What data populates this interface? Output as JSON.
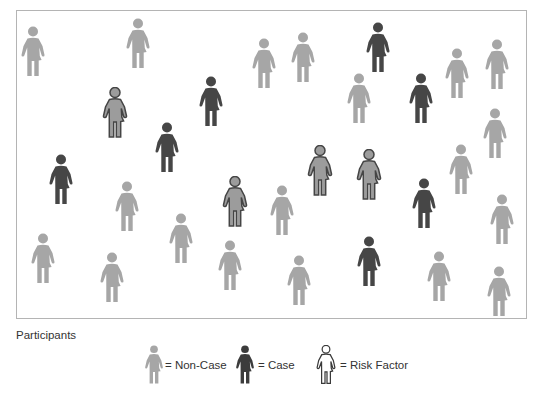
{
  "figure": {
    "title": "Participants",
    "colors": {
      "non_case": "#a6a6a6",
      "case": "#464646",
      "risk_fill": "#9c9c9c",
      "risk_stroke": "#454545",
      "frame": "#b4b4b4"
    },
    "participants": [
      {
        "type": "non_case",
        "x": 33,
        "y": 52
      },
      {
        "type": "non_case",
        "x": 138,
        "y": 44
      },
      {
        "type": "non_case",
        "x": 264,
        "y": 64
      },
      {
        "type": "non_case",
        "x": 303,
        "y": 58
      },
      {
        "type": "case",
        "x": 378,
        "y": 48
      },
      {
        "type": "non_case",
        "x": 457,
        "y": 74
      },
      {
        "type": "non_case",
        "x": 497,
        "y": 65
      },
      {
        "type": "risk_factor",
        "x": 115,
        "y": 113
      },
      {
        "type": "case",
        "x": 211,
        "y": 102
      },
      {
        "type": "non_case",
        "x": 359,
        "y": 99
      },
      {
        "type": "case",
        "x": 421,
        "y": 99
      },
      {
        "type": "case",
        "x": 167,
        "y": 148
      },
      {
        "type": "non_case",
        "x": 495,
        "y": 134
      },
      {
        "type": "case",
        "x": 61,
        "y": 180
      },
      {
        "type": "risk_factor",
        "x": 320,
        "y": 171
      },
      {
        "type": "risk_factor",
        "x": 369,
        "y": 175
      },
      {
        "type": "non_case",
        "x": 461,
        "y": 170
      },
      {
        "type": "non_case",
        "x": 127,
        "y": 207
      },
      {
        "type": "risk_factor",
        "x": 235,
        "y": 202
      },
      {
        "type": "non_case",
        "x": 282,
        "y": 211
      },
      {
        "type": "case",
        "x": 424,
        "y": 204
      },
      {
        "type": "non_case",
        "x": 502,
        "y": 220
      },
      {
        "type": "non_case",
        "x": 181,
        "y": 239
      },
      {
        "type": "non_case",
        "x": 43,
        "y": 259
      },
      {
        "type": "non_case",
        "x": 112,
        "y": 278
      },
      {
        "type": "non_case",
        "x": 230,
        "y": 266
      },
      {
        "type": "non_case",
        "x": 299,
        "y": 281
      },
      {
        "type": "case",
        "x": 369,
        "y": 262
      },
      {
        "type": "non_case",
        "x": 439,
        "y": 277
      },
      {
        "type": "non_case",
        "x": 499,
        "y": 292
      }
    ],
    "counts": {
      "total": 30,
      "non_case": 19,
      "case": 7,
      "risk_factor": 4
    }
  },
  "legend": {
    "items": [
      {
        "key": "non_case",
        "label": "= Non-Case",
        "icon": "person-gray-icon"
      },
      {
        "key": "case",
        "label": "= Case",
        "icon": "person-dark-icon"
      },
      {
        "key": "risk_factor",
        "label": "= Risk Factor",
        "icon": "person-outline-icon"
      }
    ]
  }
}
